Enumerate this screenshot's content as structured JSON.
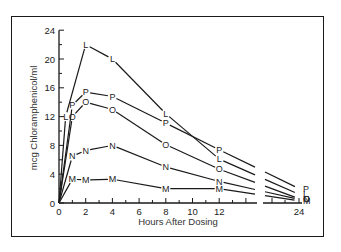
{
  "chart_data": {
    "type": "line",
    "title": "",
    "xlabel": "Hours After Dosing",
    "ylabel": "mcg Chloramphenicol/ml",
    "xlim": [
      0,
      24
    ],
    "ylim": [
      0,
      24
    ],
    "x_ticks": [
      0,
      2,
      4,
      6,
      8,
      10,
      12,
      24
    ],
    "y_ticks": [
      0,
      4,
      8,
      12,
      16,
      20,
      24
    ],
    "x_axis_break": "between 14 and 22 hours",
    "grid": false,
    "legend": "none; series marked with letter symbols L, P, O, N, M",
    "series": [
      {
        "name": "L",
        "x": [
          0,
          0.5,
          2,
          4,
          8,
          12,
          24
        ],
        "values": [
          0,
          12,
          22,
          20,
          12.4,
          6.1,
          1.2
        ]
      },
      {
        "name": "P",
        "x": [
          0,
          1,
          2,
          4,
          8,
          12,
          24
        ],
        "values": [
          0,
          13.6,
          15.4,
          14.8,
          11.1,
          7.4,
          2.0
        ]
      },
      {
        "name": "O",
        "x": [
          0,
          1,
          2,
          4,
          8,
          12,
          24
        ],
        "values": [
          0,
          12,
          14,
          13,
          8.1,
          4.7,
          0.6
        ]
      },
      {
        "name": "N",
        "x": [
          0,
          1,
          2,
          4,
          8,
          12,
          24
        ],
        "values": [
          0,
          6.5,
          7.3,
          8,
          5,
          3,
          0.5
        ]
      },
      {
        "name": "M",
        "x": [
          0,
          1,
          2,
          4,
          8,
          12,
          24
        ],
        "values": [
          0,
          3.3,
          3.2,
          3.3,
          2.0,
          2.0,
          0.3
        ]
      }
    ]
  }
}
